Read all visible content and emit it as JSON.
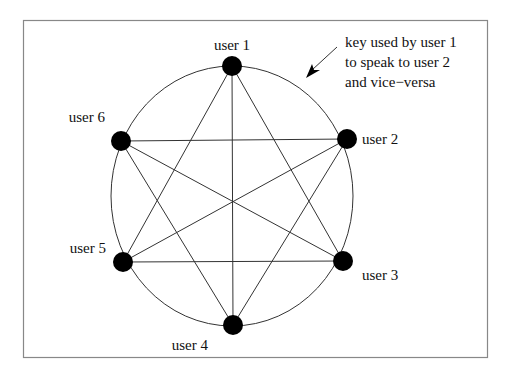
{
  "diagram": {
    "nodes": [
      {
        "id": 1,
        "label": "user 1",
        "x": 232,
        "y": 66,
        "lx": 232,
        "ly": 50,
        "anchor": "middle"
      },
      {
        "id": 2,
        "label": "user 2",
        "x": 347,
        "y": 139,
        "lx": 362,
        "ly": 144,
        "anchor": "start"
      },
      {
        "id": 3,
        "label": "user 3",
        "x": 343,
        "y": 261,
        "lx": 362,
        "ly": 280,
        "anchor": "start"
      },
      {
        "id": 4,
        "label": "user 4",
        "x": 233,
        "y": 325,
        "lx": 208,
        "ly": 350,
        "anchor": "end"
      },
      {
        "id": 5,
        "label": "user 5",
        "x": 123,
        "y": 262,
        "lx": 106,
        "ly": 253,
        "anchor": "end"
      },
      {
        "id": 6,
        "label": "user 6",
        "x": 121,
        "y": 141,
        "lx": 105,
        "ly": 122,
        "anchor": "end"
      }
    ],
    "edges": [
      [
        1,
        3
      ],
      [
        1,
        4
      ],
      [
        1,
        5
      ],
      [
        2,
        4
      ],
      [
        2,
        5
      ],
      [
        2,
        6
      ],
      [
        3,
        5
      ],
      [
        3,
        6
      ],
      [
        4,
        6
      ]
    ],
    "annotation": {
      "lines": [
        "key used by user 1",
        "to speak to user 2",
        "and vice−versa"
      ]
    },
    "colors": {
      "node": "#000000",
      "line": "#333333",
      "frame": "#888888"
    }
  }
}
